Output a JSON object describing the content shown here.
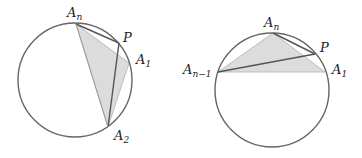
{
  "left_figure": {
    "labels": {
      "An": "A",
      "An_sub": "n",
      "P": "P",
      "A1": "A",
      "A1_sub": "1",
      "A2": "A",
      "A2_sub": "2"
    }
  },
  "right_figure": {
    "labels": {
      "An": "A",
      "An_sub": "n",
      "P": "P",
      "A1": "A",
      "A1_sub": "1",
      "An1": "A",
      "An1_sub": "n−1"
    }
  },
  "colors": {
    "stroke": "#666666",
    "fill": "#dcdcdc",
    "chord": "#555555"
  }
}
